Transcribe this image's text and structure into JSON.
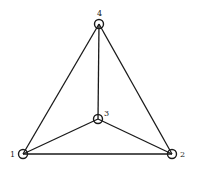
{
  "diagram": {
    "type": "graph",
    "nodes": [
      {
        "id": "1",
        "label": "1"
      },
      {
        "id": "2",
        "label": "2"
      },
      {
        "id": "3",
        "label": "3"
      },
      {
        "id": "4",
        "label": "4"
      }
    ],
    "edges": [
      {
        "from": "1",
        "to": "4"
      },
      {
        "from": "2",
        "to": "4"
      },
      {
        "from": "3",
        "to": "4"
      },
      {
        "from": "1",
        "to": "3"
      },
      {
        "from": "2",
        "to": "3"
      },
      {
        "from": "1",
        "to": "2"
      }
    ],
    "colors": {
      "stroke": "#1a1a1a",
      "background": "#ffffff"
    }
  }
}
